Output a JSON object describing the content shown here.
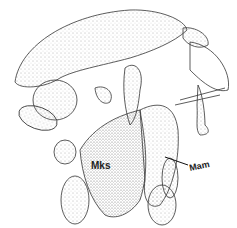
{
  "figure": {
    "type": "anatomical-line-drawing",
    "style": "stippled",
    "labels": [
      {
        "id": "mks",
        "text": "Mks"
      },
      {
        "id": "mam",
        "text": "Mam"
      }
    ]
  }
}
